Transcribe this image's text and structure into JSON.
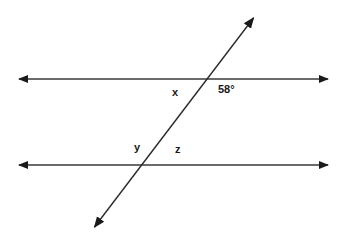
{
  "diagram": {
    "type": "parallel-lines-cut-by-transversal",
    "line_color": "#2a2a2a",
    "lines": {
      "top_parallel": {
        "x1": 17,
        "y1": 79,
        "x2": 330,
        "y2": 79,
        "arrows": "both"
      },
      "bottom_parallel": {
        "x1": 17,
        "y1": 165,
        "x2": 330,
        "y2": 165,
        "arrows": "both"
      },
      "transversal": {
        "x1": 93,
        "y1": 229,
        "x2": 255,
        "y2": 16,
        "arrows": "both"
      }
    },
    "labels": {
      "x": "x",
      "angle_58": "58°",
      "y": "y",
      "z": "z"
    }
  }
}
